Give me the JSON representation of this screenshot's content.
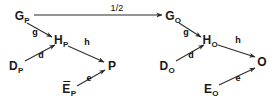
{
  "diagram": {
    "type": "commutative-diagram",
    "width": 277,
    "height": 105,
    "background_color": "#ffffff",
    "stroke_color": "#2b2b2b",
    "text_color": "#1a1a1a",
    "nodes": [
      {
        "id": "G_P",
        "base": "G",
        "sub": "P",
        "overline": false,
        "x": 22,
        "y": 16
      },
      {
        "id": "H_P",
        "base": "H",
        "sub": "P",
        "overline": false,
        "x": 61,
        "y": 40
      },
      {
        "id": "D_P",
        "base": "D",
        "sub": "P",
        "overline": false,
        "x": 16,
        "y": 66
      },
      {
        "id": "P",
        "base": "P",
        "sub": "",
        "overline": false,
        "x": 112,
        "y": 66
      },
      {
        "id": "E_P",
        "base": "E",
        "sub": "P",
        "overline": true,
        "x": 69,
        "y": 89
      },
      {
        "id": "G_O",
        "base": "G",
        "sub": "O",
        "overline": false,
        "x": 173,
        "y": 16
      },
      {
        "id": "H_O",
        "base": "H",
        "sub": "O",
        "overline": false,
        "x": 210,
        "y": 40
      },
      {
        "id": "D_O",
        "base": "D",
        "sub": "O",
        "overline": false,
        "x": 167,
        "y": 66
      },
      {
        "id": "O",
        "base": "O",
        "sub": "",
        "overline": false,
        "x": 262,
        "y": 62
      },
      {
        "id": "E_O",
        "base": "E",
        "sub": "O",
        "overline": false,
        "x": 211,
        "y": 89
      }
    ],
    "edges": [
      {
        "id": "edge-half",
        "label": "1/2",
        "from": "G_P",
        "to": "G_O",
        "label_x": 117,
        "label_y": 8,
        "x1": 34,
        "y1": 15,
        "x2": 162,
        "y2": 15
      },
      {
        "id": "edge-g-p",
        "label": "g",
        "from": "G_P",
        "to": "H_P",
        "label_x": 35,
        "label_y": 32,
        "x1": 27,
        "y1": 23,
        "x2": 52,
        "y2": 37
      },
      {
        "id": "edge-d-p",
        "label": "d",
        "from": "D_P",
        "to": "H_P",
        "label_x": 41,
        "label_y": 55,
        "x1": 25,
        "y1": 61,
        "x2": 55,
        "y2": 45
      },
      {
        "id": "edge-h-p",
        "label": "h",
        "from": "H_P",
        "to": "P",
        "label_x": 87,
        "label_y": 42,
        "x1": 68,
        "y1": 46,
        "x2": 104,
        "y2": 62
      },
      {
        "id": "edge-e-p",
        "label": "e",
        "from": "E_P",
        "to": "P",
        "label_x": 89,
        "label_y": 78,
        "x1": 77,
        "y1": 86,
        "x2": 105,
        "y2": 70
      },
      {
        "id": "edge-g-o",
        "label": "g",
        "from": "G_O",
        "to": "H_O",
        "label_x": 186,
        "label_y": 32,
        "x1": 179,
        "y1": 23,
        "x2": 201,
        "y2": 37
      },
      {
        "id": "edge-d-o",
        "label": "d",
        "from": "D_O",
        "to": "H_O",
        "label_x": 191,
        "label_y": 55,
        "x1": 176,
        "y1": 61,
        "x2": 204,
        "y2": 45
      },
      {
        "id": "edge-h-o",
        "label": "h",
        "from": "H_O",
        "to": "O",
        "label_x": 238,
        "label_y": 40,
        "x1": 218,
        "y1": 45,
        "x2": 255,
        "y2": 57
      },
      {
        "id": "edge-e-o",
        "label": "e",
        "from": "E_O",
        "to": "O",
        "label_x": 238,
        "label_y": 78,
        "x1": 219,
        "y1": 85,
        "x2": 255,
        "y2": 68
      }
    ]
  }
}
